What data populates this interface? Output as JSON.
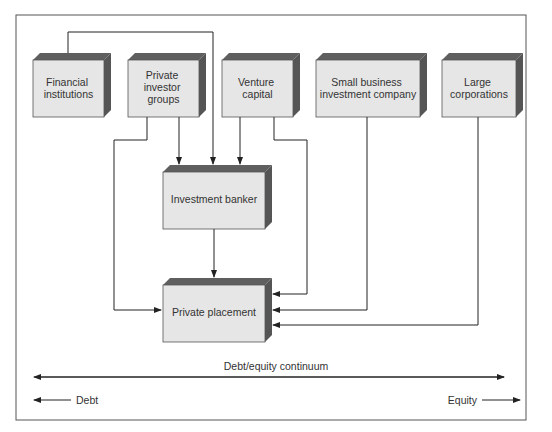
{
  "colors": {
    "box_front": "#e6e6e6",
    "box_top": "#5f5f5f",
    "box_side": "#555555",
    "line": "#222222",
    "frame": "#555555"
  },
  "nodes": [
    {
      "id": "financial",
      "lines": [
        "Financial",
        "institutions"
      ]
    },
    {
      "id": "private_investor",
      "lines": [
        "Private",
        "investor",
        "groups"
      ]
    },
    {
      "id": "venture",
      "lines": [
        "Venture",
        "capital"
      ]
    },
    {
      "id": "sbic",
      "lines": [
        "Small business",
        "investment company"
      ]
    },
    {
      "id": "large_corp",
      "lines": [
        "Large",
        "corporations"
      ]
    },
    {
      "id": "banker",
      "lines": [
        "Investment banker"
      ]
    },
    {
      "id": "placement",
      "lines": [
        "Private placement"
      ]
    }
  ],
  "edges": [
    {
      "from": "financial",
      "to": "banker"
    },
    {
      "from": "private_investor",
      "to": "banker"
    },
    {
      "from": "venture",
      "to": "banker"
    },
    {
      "from": "private_investor",
      "to": "placement"
    },
    {
      "from": "venture",
      "to": "placement"
    },
    {
      "from": "sbic",
      "to": "placement"
    },
    {
      "from": "large_corp",
      "to": "placement"
    },
    {
      "from": "banker",
      "to": "placement"
    }
  ],
  "continuum": {
    "label": "Debt/equity continuum",
    "left_label": "Debt",
    "right_label": "Equity"
  }
}
